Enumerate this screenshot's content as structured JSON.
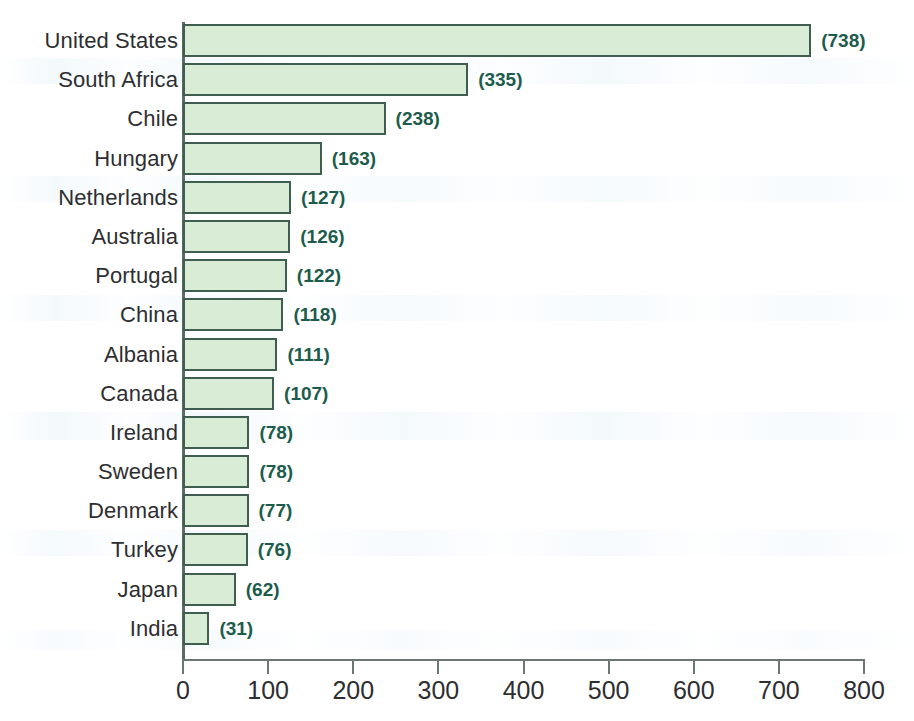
{
  "chart_data": {
    "type": "bar",
    "orientation": "horizontal",
    "title": "",
    "xlabel": "",
    "ylabel": "",
    "xlim": [
      0,
      800
    ],
    "xticks": [
      0,
      100,
      200,
      300,
      400,
      500,
      600,
      700,
      800
    ],
    "grid": false,
    "legend": null,
    "value_label_format": "(value)",
    "categories": [
      "United States",
      "South Africa",
      "Chile",
      "Hungary",
      "Netherlands",
      "Australia",
      "Portugal",
      "China",
      "Albania",
      "Canada",
      "Ireland",
      "Sweden",
      "Denmark",
      "Turkey",
      "Japan",
      "India"
    ],
    "values": [
      738,
      335,
      238,
      163,
      127,
      126,
      122,
      118,
      111,
      107,
      78,
      78,
      77,
      76,
      62,
      31
    ],
    "value_labels": [
      "(738)",
      "(335)",
      "(238)",
      "(163)",
      "(127)",
      "(126)",
      "(122)",
      "(118)",
      "(111)",
      "(107)",
      "(78)",
      "(78)",
      "(77)",
      "(76)",
      "(62)",
      "(31)"
    ]
  },
  "style": {
    "bar_fill": "#d9ecd5",
    "bar_border": "#3f5e4f",
    "value_label_color": "#1d5c4c",
    "category_label_color": "#2e2e30",
    "axis_color": "#6b7772",
    "background": "#ffffff"
  }
}
